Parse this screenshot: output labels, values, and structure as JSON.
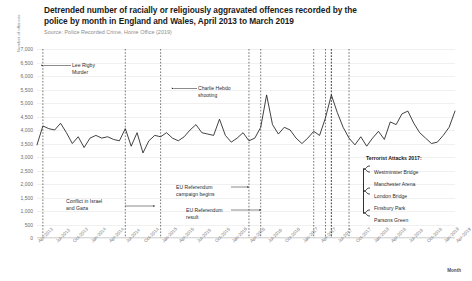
{
  "header": {
    "title": "Detrended number of racially or religiously aggravated offences recorded by the police by month in England and Wales, April 2013 to March 2019",
    "source": "Source: Police Recorded Crime, Home Office (2019)"
  },
  "axes": {
    "ylabel": "Number of offences",
    "xlabel": "Month"
  },
  "annotations": {
    "lee_rigby": "Lee Rigby\nMurder",
    "charlie_hebdo": "Charlie Hebdo\nshooting",
    "conflict_gaza": "Conflict in Israel\nand Gaza",
    "eu_campaign": "EU Referendum\ncampaign begins",
    "eu_result": "EU Referendum\nresult",
    "terror_title": "Terrorist Attacks 2017:",
    "terror_items": [
      "Westminster Bridge",
      "Manchester Arena",
      "London Bridge",
      "Finsbury Park",
      "Parsons Green"
    ]
  },
  "colors": {
    "line": "#231f20",
    "grid": "#f0f0f0",
    "event_line": "#3a3a3a",
    "axis_text": "#7a7a7a"
  },
  "chart_data": {
    "type": "line",
    "title": "Detrended number of racially or religiously aggravated offences recorded by the police by month in England and Wales, April 2013 to March 2019",
    "subtitle": "Source: Police Recorded Crime, Home Office (2019)",
    "xlabel": "Month",
    "ylabel": "Number of offences",
    "ylim": [
      0,
      7000
    ],
    "ytick_labels": [
      "0",
      "500",
      "1,000",
      "1,500",
      "2,000",
      "2,500",
      "3,000",
      "3,500",
      "4,000",
      "4,500",
      "5,000",
      "5,500",
      "6,000",
      "6,500",
      "7,000"
    ],
    "ytick_values": [
      0,
      500,
      1000,
      1500,
      2000,
      2500,
      3000,
      3500,
      4000,
      4500,
      5000,
      5500,
      6000,
      6500,
      7000
    ],
    "grid": true,
    "legend": "none",
    "xtick_labels": [
      "Apr-2013",
      "Jul-2013",
      "Oct-2013",
      "Jan-2014",
      "Apr-2014",
      "Jul-2014",
      "Oct-2014",
      "Jan-2015",
      "Apr-2015",
      "Jul-2015",
      "Oct-2015",
      "Jan-2016",
      "Apr-2016",
      "Jul-2016",
      "Oct-2016",
      "Jan-2017",
      "Apr-2017",
      "Jul-2017",
      "Oct-2017",
      "Jan-2018",
      "Apr-2018",
      "Jul-2018",
      "Oct-2018",
      "Jan-2019",
      "Apr-2019"
    ],
    "x": [
      "Apr-2013",
      "May-2013",
      "Jun-2013",
      "Jul-2013",
      "Aug-2013",
      "Sep-2013",
      "Oct-2013",
      "Nov-2013",
      "Dec-2013",
      "Jan-2014",
      "Feb-2014",
      "Mar-2014",
      "Apr-2014",
      "May-2014",
      "Jun-2014",
      "Jul-2014",
      "Aug-2014",
      "Sep-2014",
      "Oct-2014",
      "Nov-2014",
      "Dec-2014",
      "Jan-2015",
      "Feb-2015",
      "Mar-2015",
      "Apr-2015",
      "May-2015",
      "Jun-2015",
      "Jul-2015",
      "Aug-2015",
      "Sep-2015",
      "Oct-2015",
      "Nov-2015",
      "Dec-2015",
      "Jan-2016",
      "Feb-2016",
      "Mar-2016",
      "Apr-2016",
      "May-2016",
      "Jun-2016",
      "Jul-2016",
      "Aug-2016",
      "Sep-2016",
      "Oct-2016",
      "Nov-2016",
      "Dec-2016",
      "Jan-2017",
      "Feb-2017",
      "Mar-2017",
      "Apr-2017",
      "May-2017",
      "Jun-2017",
      "Jul-2017",
      "Aug-2017",
      "Sep-2017",
      "Oct-2017",
      "Nov-2017",
      "Dec-2017",
      "Jan-2018",
      "Feb-2018",
      "Mar-2018",
      "Apr-2018",
      "May-2018",
      "Jun-2018",
      "Jul-2018",
      "Aug-2018",
      "Sep-2018",
      "Oct-2018",
      "Nov-2018",
      "Dec-2018",
      "Jan-2019",
      "Feb-2019",
      "Mar-2019"
    ],
    "values": [
      3450,
      4150,
      4050,
      4000,
      4250,
      3900,
      3500,
      3750,
      3350,
      3700,
      3800,
      3700,
      3750,
      3650,
      3600,
      4050,
      3400,
      3900,
      3150,
      3600,
      3800,
      3750,
      3900,
      3700,
      3600,
      3750,
      4000,
      4200,
      3900,
      3850,
      3800,
      4400,
      3800,
      3550,
      3700,
      3900,
      3600,
      3700,
      4100,
      5300,
      4200,
      3850,
      4100,
      4000,
      3700,
      3500,
      3700,
      3950,
      3800,
      4450,
      5300,
      4650,
      4100,
      3700,
      3450,
      3750,
      3400,
      3700,
      3950,
      3650,
      4300,
      4200,
      4600,
      4700,
      4250,
      3900,
      3700,
      3500,
      3550,
      3800,
      4100,
      4700
    ],
    "event_lines": [
      {
        "label": "Lee Rigby Murder",
        "x": "May-2013",
        "index": 1
      },
      {
        "label": "Conflict in Israel and Gaza",
        "x": "Jul-2014",
        "index": 15
      },
      {
        "label": "Charlie Hebdo shooting",
        "x": "Jan-2015",
        "index": 21
      },
      {
        "label": "EU Referendum campaign begins",
        "x": "Apr-2016",
        "index": 36
      },
      {
        "label": "EU Referendum result",
        "x": "Jun-2016",
        "index": 38
      },
      {
        "label": "Westminster Bridge",
        "x": "Mar-2017",
        "index": 47
      },
      {
        "label": "Manchester Arena",
        "x": "May-2017",
        "index": 49
      },
      {
        "label": "London Bridge",
        "x": "Jun-2017",
        "index": 50
      },
      {
        "label": "Finsbury Park",
        "x": "Jun-2017",
        "index": 50
      },
      {
        "label": "Parsons Green",
        "x": "Sep-2017",
        "index": 53
      }
    ]
  }
}
